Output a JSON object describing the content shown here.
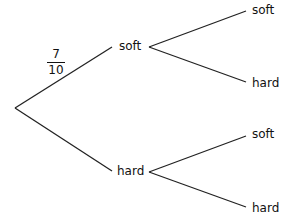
{
  "diagram": {
    "type": "probability-tree",
    "first_branch": {
      "soft": {
        "label": "soft",
        "probability": {
          "numerator": "7",
          "denominator": "10"
        }
      },
      "hard": {
        "label": "hard"
      }
    },
    "second_branch": {
      "after_soft": [
        {
          "label": "soft"
        },
        {
          "label": "hard"
        }
      ],
      "after_hard": [
        {
          "label": "soft"
        },
        {
          "label": "hard"
        }
      ]
    }
  }
}
